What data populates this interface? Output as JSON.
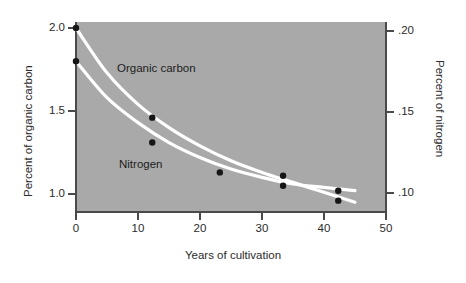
{
  "chart_data": {
    "type": "line",
    "title": "",
    "xlabel": "Years of cultivation",
    "ylabel": "Percent of organic carbon",
    "ylabel_right": "Percent of nitrogen",
    "xlim": [
      0,
      50
    ],
    "ylim": [
      0.9,
      2.05
    ],
    "ylim_right": [
      0.09,
      0.205
    ],
    "grid": false,
    "legend_position": "inline-labels",
    "background_color": "#a9a9a9",
    "curve_color": "#ffffff",
    "point_color": "#161616",
    "xticks": [
      "0",
      "10",
      "20",
      "30",
      "40",
      "50"
    ],
    "xtick_values": [
      0,
      10,
      20,
      30,
      40,
      50
    ],
    "yticks_left": [
      "2.0",
      "1.5",
      "1.0"
    ],
    "ytick_values_left": [
      2.0,
      1.5,
      1.0
    ],
    "yticks_right": [
      ".20",
      ".15",
      ".10"
    ],
    "ytick_values_right": [
      0.2,
      0.15,
      0.1
    ],
    "series": [
      {
        "name": "Organic carbon",
        "axis": "left",
        "label": "Organic carbon",
        "x": [
          0,
          12.3,
          33.4,
          42.3
        ],
        "values": [
          2.0,
          1.46,
          1.11,
          1.02
        ],
        "fitted_curve_x": [
          0,
          5,
          10,
          15,
          20,
          25,
          30,
          35,
          40,
          45
        ],
        "fitted_curve_y": [
          2.0,
          1.73,
          1.54,
          1.4,
          1.29,
          1.2,
          1.13,
          1.07,
          1.01,
          0.95
        ]
      },
      {
        "name": "Nitrogen",
        "axis": "right",
        "label": "Nitrogen",
        "x": [
          0,
          12.3,
          23.2,
          33.4,
          42.3
        ],
        "values": [
          0.18,
          0.131,
          0.113,
          0.105,
          0.096
        ],
        "values_left_scale": [
          1.8,
          1.31,
          1.13,
          1.05,
          0.96
        ],
        "fitted_curve_x": [
          0,
          5,
          10,
          15,
          20,
          25,
          30,
          35,
          40,
          45
        ],
        "fitted_curve_y": [
          1.8,
          1.58,
          1.43,
          1.31,
          1.22,
          1.15,
          1.1,
          1.06,
          1.04,
          1.02
        ]
      }
    ]
  }
}
